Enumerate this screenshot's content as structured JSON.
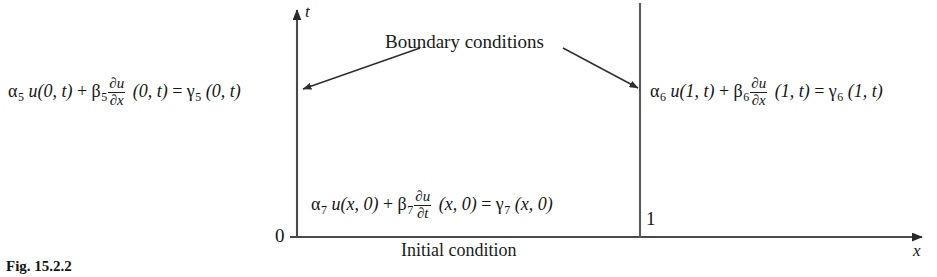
{
  "figure": {
    "caption": "Fig. 15.2.2",
    "background_color": "#ffffff",
    "line_color": "#3a3a3a",
    "text_color": "#151515"
  },
  "axes": {
    "vertical_label": "t",
    "horizontal_label": "x",
    "origin_tick": "0",
    "right_tick": "1"
  },
  "labels": {
    "boundary": "Boundary conditions",
    "initial": "Initial condition"
  },
  "equations": {
    "left": {
      "alpha": "α",
      "alpha_sub": "5",
      "u_term": "u(0, t)",
      "plus": "+",
      "beta": "β",
      "beta_sub": "5",
      "frac_num": "∂u",
      "frac_den": "∂x",
      "arg": "(0, t)",
      "equals": "=",
      "gamma": "γ",
      "gamma_sub": "5",
      "rhs_arg": "(0, t)"
    },
    "right": {
      "alpha": "α",
      "alpha_sub": "6",
      "u_term": "u(1, t)",
      "plus": "+",
      "beta": "β",
      "beta_sub": "6",
      "frac_num": "∂u",
      "frac_den": "∂x",
      "arg": "(1, t)",
      "equals": "=",
      "gamma": "γ",
      "gamma_sub": "6",
      "rhs_arg": "(1, t)"
    },
    "initial": {
      "alpha": "α",
      "alpha_sub": "7",
      "u_term": "u(x, 0)",
      "plus": "+",
      "beta": "β",
      "beta_sub": "7",
      "frac_num": "∂u",
      "frac_den": "∂t",
      "arg": "(x, 0)",
      "equals": "=",
      "gamma": "γ",
      "gamma_sub": "7",
      "rhs_arg": "(x, 0)"
    }
  }
}
